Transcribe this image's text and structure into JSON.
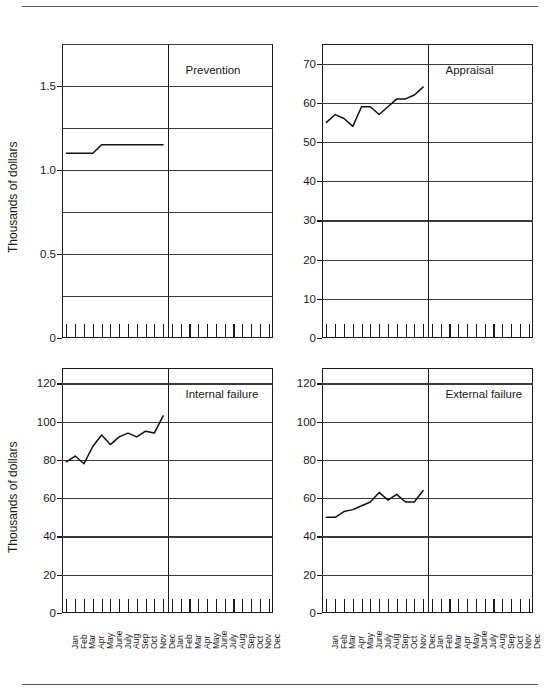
{
  "chart_data": [
    {
      "type": "line",
      "title": "Prevention",
      "ylabel": "Thousands of dollars",
      "xlabel": "",
      "ylim": [
        0,
        1.75
      ],
      "yticks": [
        0,
        0.5,
        1.0,
        1.5
      ],
      "ytick_labels": [
        "0",
        "0.5",
        "1.0",
        "1.5"
      ],
      "gridlines": [
        0.25,
        0.5,
        0.75,
        1.0,
        1.25,
        1.5,
        1.75
      ],
      "grid": true,
      "legend": "none",
      "categories": [
        "Jan",
        "Feb",
        "Mar",
        "Apr",
        "May",
        "June",
        "July",
        "Aug",
        "Sep",
        "Oct",
        "Nov",
        "Dec"
      ],
      "values": [
        1.1,
        1.1,
        1.1,
        1.1,
        1.15,
        1.15,
        1.15,
        1.15,
        1.15,
        1.15,
        1.15,
        1.15
      ],
      "second_panel_empty": true
    },
    {
      "type": "line",
      "title": "Appraisal",
      "ylabel": "",
      "xlabel": "",
      "ylim": [
        0,
        75
      ],
      "yticks": [
        0,
        10,
        20,
        30,
        40,
        50,
        60,
        70
      ],
      "ytick_labels": [
        "0",
        "10",
        "20",
        "30",
        "40",
        "50",
        "60",
        "70"
      ],
      "gridlines": [
        10,
        20,
        30,
        40,
        50,
        60,
        70
      ],
      "grid": true,
      "legend": "none",
      "categories": [
        "Jan",
        "Feb",
        "Mar",
        "Apr",
        "May",
        "June",
        "July",
        "Aug",
        "Sep",
        "Oct",
        "Nov",
        "Dec"
      ],
      "values": [
        55,
        57,
        56,
        54,
        59,
        59,
        57,
        59,
        61,
        61,
        62,
        64
      ],
      "second_panel_empty": true
    },
    {
      "type": "line",
      "title": "Internal failure",
      "ylabel": "Thousands of dollars",
      "xlabel": "",
      "ylim": [
        0,
        128
      ],
      "yticks": [
        0,
        20,
        40,
        60,
        80,
        100,
        120
      ],
      "ytick_labels": [
        "0",
        "20",
        "40",
        "60",
        "80",
        "100",
        "120"
      ],
      "gridlines": [
        20,
        40,
        60,
        80,
        100,
        120
      ],
      "grid": true,
      "legend": "none",
      "categories": [
        "Jan",
        "Feb",
        "Mar",
        "Apr",
        "May",
        "June",
        "July",
        "Aug",
        "Sep",
        "Oct",
        "Nov",
        "Dec"
      ],
      "values": [
        79,
        82,
        78,
        87,
        93,
        88,
        92,
        94,
        92,
        95,
        94,
        103
      ],
      "second_panel_empty": true
    },
    {
      "type": "line",
      "title": "External failure",
      "ylabel": "",
      "xlabel": "",
      "ylim": [
        0,
        128
      ],
      "yticks": [
        0,
        20,
        40,
        60,
        80,
        100,
        120
      ],
      "ytick_labels": [
        "0",
        "20",
        "40",
        "60",
        "80",
        "100",
        "120"
      ],
      "gridlines": [
        20,
        40,
        60,
        80,
        100,
        120
      ],
      "grid": true,
      "legend": "none",
      "categories": [
        "Jan",
        "Feb",
        "Mar",
        "Apr",
        "May",
        "June",
        "July",
        "Aug",
        "Sep",
        "Oct",
        "Nov",
        "Dec"
      ],
      "values": [
        50,
        50,
        53,
        54,
        56,
        58,
        63,
        59,
        62,
        58,
        58,
        64
      ],
      "second_panel_empty": true
    }
  ],
  "figure": {
    "axis_title_left_top": "Thousands of dollars",
    "axis_title_left_bottom": "Thousands of dollars",
    "months": [
      "Jan",
      "Feb",
      "Mar",
      "Apr",
      "May",
      "June",
      "July",
      "Aug",
      "Sep",
      "Oct",
      "Nov",
      "Dec"
    ]
  }
}
